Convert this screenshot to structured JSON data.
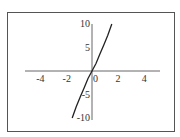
{
  "chart_data": {
    "type": "line",
    "title": "",
    "xlabel": "",
    "ylabel": "",
    "xlim": [
      -5,
      5
    ],
    "ylim": [
      -10,
      10
    ],
    "grid": false,
    "x_ticks": [
      "-4",
      "-2",
      "0",
      "2",
      "4"
    ],
    "y_ticks": [
      "10",
      "5",
      "-5",
      "-10"
    ],
    "series": [
      {
        "name": "f(x)",
        "x": [
          -1.5,
          -1.2,
          -0.9,
          -0.6,
          -0.3,
          0,
          0.3,
          0.6,
          0.9,
          1.2,
          1.5
        ],
        "y": [
          -10,
          -7.6,
          -5.6,
          -3.6,
          -1.6,
          0,
          1.6,
          3.6,
          5.6,
          7.6,
          10
        ]
      }
    ]
  },
  "labels": {
    "xt": [
      "-4",
      "-2",
      "0",
      "2",
      "4"
    ],
    "yt": [
      "10",
      "5",
      "-5",
      "-10"
    ]
  }
}
